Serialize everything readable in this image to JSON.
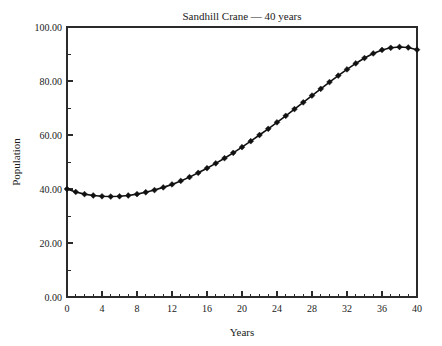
{
  "chart_data": {
    "type": "line",
    "title": "Sandhill Crane — 40 years",
    "xlabel": "Years",
    "ylabel": "Population",
    "xlim": [
      0,
      40
    ],
    "ylim": [
      0,
      100
    ],
    "grid": false,
    "legend": false,
    "marker": "diamond",
    "line_color": "#111111",
    "marker_color": "#111111",
    "x_tick_labels": [
      "0",
      "4",
      "8",
      "12",
      "16",
      "20",
      "24",
      "28",
      "32",
      "36",
      "40"
    ],
    "x_tick_values": [
      0,
      4,
      8,
      12,
      16,
      20,
      24,
      28,
      32,
      36,
      40
    ],
    "x_minor_step": 1,
    "y_tick_labels": [
      "0.00",
      "20.00",
      "40.00",
      "60.00",
      "80.00",
      "100.00"
    ],
    "y_tick_values": [
      0,
      20,
      40,
      60,
      80,
      100
    ],
    "y_minor_step": 10,
    "series": [
      {
        "name": "Sandhill Crane",
        "x": [
          0,
          1,
          2,
          3,
          4,
          5,
          6,
          7,
          8,
          9,
          10,
          11,
          12,
          13,
          14,
          15,
          16,
          17,
          18,
          19,
          20,
          21,
          22,
          23,
          24,
          25,
          26,
          27,
          28,
          29,
          30,
          31,
          32,
          33,
          34,
          35,
          36,
          37,
          38,
          39,
          40
        ],
        "values": [
          40.0,
          38.9,
          38.1,
          37.6,
          37.3,
          37.2,
          37.3,
          37.6,
          38.1,
          38.8,
          39.6,
          40.6,
          41.7,
          43.0,
          44.4,
          46.0,
          47.7,
          49.5,
          51.4,
          53.4,
          55.5,
          57.7,
          60.0,
          62.3,
          64.7,
          67.1,
          69.6,
          72.1,
          74.6,
          77.1,
          79.6,
          82.0,
          84.3,
          86.5,
          88.5,
          90.2,
          91.5,
          92.3,
          92.6,
          92.4,
          91.6
        ]
      }
    ]
  }
}
